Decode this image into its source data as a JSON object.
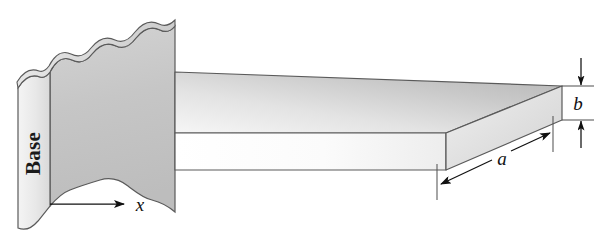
{
  "figure": {
    "type": "engineering-diagram",
    "background_color": "#ffffff",
    "width": 602,
    "height": 250
  },
  "labels": {
    "base": "Base",
    "length_a": "a",
    "thickness_b": "b",
    "axis_x": "x"
  },
  "annotations": {
    "base_text_orientation": "rotated 90 degrees counter-clockwise, reading bottom to top",
    "a_description": "beam width dimension along the front-right bottom edge, double ended arrow",
    "b_description": "beam thickness dimension at the right end, vertical double ended arrow",
    "x_description": "horizontal axis arrow pointing right from the base"
  },
  "colors": {
    "wall_front_face": "#c9c9c9",
    "wall_side_face": "#ededed",
    "wall_top_break": "#d6d6d6",
    "beam_top_face_light": "#f2f2f2",
    "beam_top_face_dark": "#b9b9b9",
    "beam_front_face": "#fbfbfb",
    "beam_end_face": "#dcdcdc",
    "outline": "#4c4c4c",
    "dimension_line": "#111111",
    "text": "#111111"
  },
  "geometry": {
    "wall_right_edge_x": 175,
    "beam_top_back_y": 72,
    "beam_end_top_y": 86,
    "beam_end_bottom_y": 120,
    "beam_front_bottom_y": 170,
    "beam_right_x": 562
  }
}
